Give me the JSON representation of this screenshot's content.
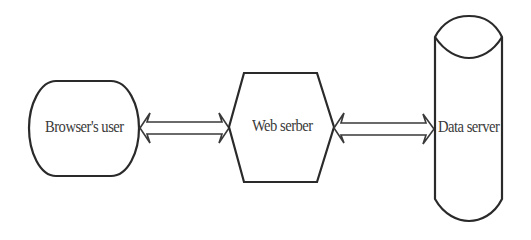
{
  "diagram": {
    "nodes": [
      {
        "id": "browser-user",
        "label": "Browser's user",
        "shape": "rounded-rectangle"
      },
      {
        "id": "web-server",
        "label": "Web serber",
        "shape": "hexagon"
      },
      {
        "id": "data-server",
        "label": "Data server",
        "shape": "cylinder"
      }
    ],
    "edges": [
      {
        "from": "browser-user",
        "to": "web-server",
        "type": "bidirectional-block-arrow"
      },
      {
        "from": "web-server",
        "to": "data-server",
        "type": "bidirectional-block-arrow"
      }
    ],
    "colors": {
      "stroke": "#2a2a2a",
      "fill": "#ffffff",
      "text": "#3a3a3a"
    }
  }
}
